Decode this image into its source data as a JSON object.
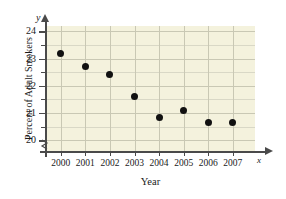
{
  "chart_data": {
    "type": "scatter",
    "title": "",
    "xlabel": "Year",
    "ylabel": "Percent of Adult Smokers",
    "x_var_symbol": "x",
    "y_var_symbol": "y",
    "categories": [
      "2000",
      "2001",
      "2002",
      "2003",
      "2004",
      "2005",
      "2006",
      "2007"
    ],
    "x": [
      2000,
      2001,
      2002,
      2003,
      2004,
      2005,
      2006,
      2007
    ],
    "values": [
      23.2,
      22.7,
      22.4,
      21.6,
      20.85,
      21.1,
      20.65,
      20.65
    ],
    "series": [
      {
        "name": "Percent of Adult Smokers",
        "values": [
          23.2,
          22.7,
          22.4,
          21.6,
          20.85,
          21.1,
          20.65,
          20.65
        ]
      }
    ],
    "xlim": [
      1999.4,
      2007.9
    ],
    "ylim": [
      19.6,
      24.2
    ],
    "y_ticks": [
      20,
      21,
      22,
      23,
      24
    ],
    "y_tick_labels": [
      "20",
      "21",
      "22",
      "23",
      "24"
    ],
    "y_minor_ticks": [
      20.5,
      21.5,
      22.5,
      23.5
    ],
    "x_ticks": [
      2000,
      2001,
      2002,
      2003,
      2004,
      2005,
      2006,
      2007
    ],
    "x_tick_labels": [
      "2000",
      "2001",
      "2002",
      "2003",
      "2004",
      "2005",
      "2006",
      "2007"
    ],
    "grid": true,
    "grid_major_horizontal": [
      20,
      21,
      22,
      23,
      24
    ],
    "grid_minor_horizontal": [
      20.5,
      21.5,
      22.5,
      23.5
    ],
    "grid_vertical": [
      2000,
      2001,
      2002,
      2003,
      2004,
      2005,
      2006,
      2007
    ],
    "legend": null,
    "axis_break_y": true,
    "colors": {
      "plot_background": "#f4f2dd",
      "page_background": "#ffffff",
      "grid_major": "#c9c8b4",
      "grid_minor": "#d9d8c6",
      "axis": "#4a4a4a",
      "marker": "#111111",
      "text": "#1a1a1a"
    }
  }
}
